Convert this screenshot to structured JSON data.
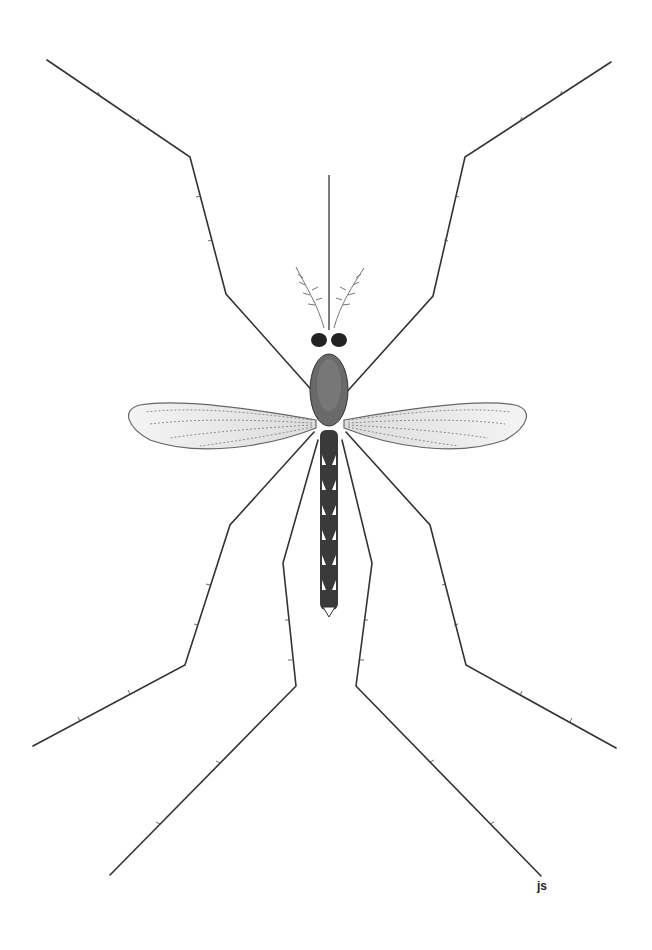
{
  "illustration": {
    "subject": "mosquito",
    "view": "dorsal",
    "style": "black-and-white stipple/line scientific illustration",
    "signature": "js",
    "colors": {
      "background": "#ffffff",
      "ink": "#222222",
      "shade": "#555555"
    }
  }
}
